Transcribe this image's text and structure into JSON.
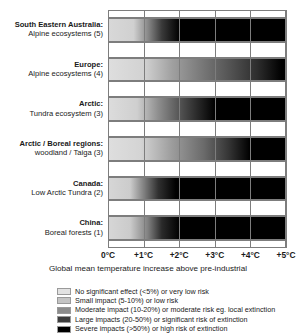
{
  "chart_data": {
    "type": "heatmap",
    "title": "",
    "xlabel": "Global mean temperature increase above pre-industrial",
    "ylabel": "",
    "xlim": [
      0,
      5
    ],
    "grid": true,
    "legend_position": "bottom",
    "tick_labels": [
      "0°C",
      "+1°C",
      "+2°C",
      "+3°C",
      "+4°C",
      "+5°C"
    ],
    "tick_values": [
      0,
      1,
      2,
      3,
      4,
      5
    ],
    "categories": [
      "South Eastern Australia: Alpine ecosystems (5)",
      "Europe: Alpine ecosystems (4)",
      "Arctic: Tundra ecosystem (3)",
      "Arctic / Boreal regions: woodland / Taiga (3)",
      "Canada: Low Arctic Tundra (2)",
      "China: Boreal forests (1)"
    ],
    "rows": [
      {
        "region": "South Eastern Australia:",
        "ecosystem": "Alpine ecosystems (5)",
        "reference": 5,
        "onset_c": 0.7,
        "severe_c": 2.0,
        "stops": [
          {
            "t": 0.0,
            "shade": "#d8d8d8"
          },
          {
            "t": 0.7,
            "shade": "#d0d0d0"
          },
          {
            "t": 1.1,
            "shade": "#8a8a8a"
          },
          {
            "t": 1.5,
            "shade": "#3a3a3a"
          },
          {
            "t": 2.0,
            "shade": "#000000"
          },
          {
            "t": 5.0,
            "shade": "#000000"
          }
        ]
      },
      {
        "region": "Europe:",
        "ecosystem": "Alpine ecosystems (4)",
        "reference": 4,
        "onset_c": 1.0,
        "severe_c": 4.9,
        "stops": [
          {
            "t": 0.0,
            "shade": "#dedede"
          },
          {
            "t": 1.0,
            "shade": "#d2d2d2"
          },
          {
            "t": 1.8,
            "shade": "#a0a0a0"
          },
          {
            "t": 2.6,
            "shade": "#7a7a7a"
          },
          {
            "t": 3.4,
            "shade": "#555555"
          },
          {
            "t": 4.2,
            "shade": "#2e2e2e"
          },
          {
            "t": 4.9,
            "shade": "#000000"
          },
          {
            "t": 5.0,
            "shade": "#000000"
          }
        ]
      },
      {
        "region": "Arctic:",
        "ecosystem": "Tundra ecosystem (3)",
        "reference": 3,
        "onset_c": 0.8,
        "severe_c": 3.0,
        "stops": [
          {
            "t": 0.0,
            "shade": "#dcdcdc"
          },
          {
            "t": 0.8,
            "shade": "#cfcfcf"
          },
          {
            "t": 1.4,
            "shade": "#8e8e8e"
          },
          {
            "t": 2.1,
            "shade": "#4c4c4c"
          },
          {
            "t": 3.0,
            "shade": "#000000"
          },
          {
            "t": 5.0,
            "shade": "#000000"
          }
        ]
      },
      {
        "region": "Arctic / Boreal regions:",
        "ecosystem": "woodland / Taiga (3)",
        "reference": 3,
        "onset_c": 0.9,
        "severe_c": 4.0,
        "stops": [
          {
            "t": 0.0,
            "shade": "#dedede"
          },
          {
            "t": 0.9,
            "shade": "#d4d4d4"
          },
          {
            "t": 1.8,
            "shade": "#9c9c9c"
          },
          {
            "t": 2.7,
            "shade": "#6a6a6a"
          },
          {
            "t": 3.4,
            "shade": "#353535"
          },
          {
            "t": 4.0,
            "shade": "#000000"
          },
          {
            "t": 5.0,
            "shade": "#000000"
          }
        ]
      },
      {
        "region": "Canada:",
        "ecosystem": "Low Arctic Tundra (2)",
        "reference": 2,
        "onset_c": 0.6,
        "severe_c": 1.9,
        "stops": [
          {
            "t": 0.0,
            "shade": "#d6d6d6"
          },
          {
            "t": 0.6,
            "shade": "#cccccc"
          },
          {
            "t": 1.0,
            "shade": "#7e7e7e"
          },
          {
            "t": 1.4,
            "shade": "#303030"
          },
          {
            "t": 1.9,
            "shade": "#000000"
          },
          {
            "t": 5.0,
            "shade": "#000000"
          }
        ]
      },
      {
        "region": "China:",
        "ecosystem": "Boreal forests (1)",
        "reference": 1,
        "onset_c": 0.6,
        "severe_c": 2.0,
        "stops": [
          {
            "t": 0.0,
            "shade": "#d6d6d6"
          },
          {
            "t": 0.6,
            "shade": "#cbcbcb"
          },
          {
            "t": 1.1,
            "shade": "#828282"
          },
          {
            "t": 1.5,
            "shade": "#2a2a2a"
          },
          {
            "t": 2.0,
            "shade": "#000000"
          },
          {
            "t": 5.0,
            "shade": "#000000"
          }
        ]
      }
    ],
    "legend": [
      {
        "label": "No significant effect (<5%) or very low risk",
        "color": "#e2e2e2"
      },
      {
        "label": "Small impact (5-10%) or low risk",
        "color": "#c4c4c4"
      },
      {
        "label": "Moderate impact (10-20%) or moderate risk eg. local extinction",
        "color": "#8c8c8c"
      },
      {
        "label": "Large impacts (20-50%) or significant risk of extinction",
        "color": "#3d3d3d"
      },
      {
        "label": "Severe impacts (>50%) or high risk of extinction",
        "color": "#000000"
      }
    ]
  }
}
